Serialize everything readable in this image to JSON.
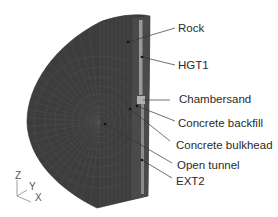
{
  "figure": {
    "mesh_color": "#3d3d3d",
    "mesh_line_color": "#5a5a5a",
    "strip_color": "#8a8a8a"
  },
  "labels": [
    {
      "id": "rock",
      "text": "Rock"
    },
    {
      "id": "hgt1",
      "text": "HGT1"
    },
    {
      "id": "chambersand",
      "text": "Chambersand"
    },
    {
      "id": "concrete-backfill",
      "text": "Concrete backfill"
    },
    {
      "id": "concrete-bulkhead",
      "text": "Concrete bulkhead"
    },
    {
      "id": "open-tunnel",
      "text": "Open tunnel"
    },
    {
      "id": "ext2",
      "text": "EXT2"
    }
  ],
  "axes_triad": {
    "z": "Z",
    "y": "Y",
    "x": "X"
  }
}
